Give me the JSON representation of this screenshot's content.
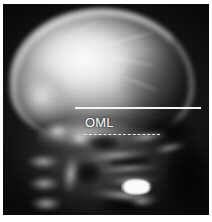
{
  "figure": {
    "kind": "lateral-skull-radiograph",
    "modality": "X-ray",
    "view": "lateral",
    "background_color": "#ffffff",
    "film_color": "#060606"
  },
  "annotations": {
    "label": "OML",
    "label_meaning": "Orbitomeatal Line",
    "label_color": "#ffffff",
    "solid_line": {
      "name": "baseline-reference-line",
      "color": "#f4f4f4",
      "style": "solid"
    },
    "dashed_line": {
      "name": "oml-reference-line",
      "color": "#efefef",
      "style": "dashed"
    }
  },
  "anatomy": {
    "cranial_vault": "cranial-vault",
    "occipital_bone": "occipital-bone",
    "skull_base": "skull-base",
    "facial_skeleton": "facial-skeleton",
    "dental_restoration": "dental-restoration",
    "air_spaces": "paranasal-sinuses-and-nasopharynx",
    "cervical_spine": "cervical-spine"
  }
}
